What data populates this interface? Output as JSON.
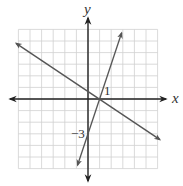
{
  "chart_data": {
    "type": "line",
    "title": "",
    "xlabel": "x",
    "ylabel": "y",
    "xlim": [
      -6,
      6
    ],
    "ylim": [
      -6,
      6
    ],
    "grid": true,
    "annotations": [
      {
        "text": "1",
        "x": 1,
        "y": 0,
        "meaning": "x-intercept"
      },
      {
        "text": "-3",
        "x": 0,
        "y": -3,
        "meaning": "y-intercept"
      }
    ],
    "series": [
      {
        "name": "line-steep",
        "equation": "y = 3x - 3",
        "points": [
          [
            -0.9,
            -5.7
          ],
          [
            2.0,
            3.0
          ],
          [
            2.9,
            5.7
          ]
        ]
      },
      {
        "name": "line-decreasing",
        "equation": "y = -2/3 x + 2/3",
        "points": [
          [
            -6.2,
            4.8
          ],
          [
            1,
            0
          ],
          [
            6.2,
            -3.5
          ]
        ]
      }
    ]
  },
  "labels": {
    "x_axis": "x",
    "y_axis": "y",
    "tick_one": "1",
    "tick_neg_three": "−3"
  }
}
